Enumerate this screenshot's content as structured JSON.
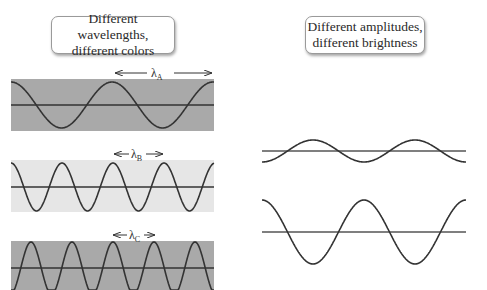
{
  "left_panel": {
    "title_line1": "Different wavelengths,",
    "title_line2": "different colors",
    "waves": [
      {
        "id": "A",
        "label": "λ",
        "subscript": "A",
        "background": "#a9a9a9",
        "wavelength_px": 101,
        "amplitude_px": 24
      },
      {
        "id": "B",
        "label": "λ",
        "subscript": "B",
        "background": "#e6e6e6",
        "wavelength_px": 51,
        "amplitude_px": 24
      },
      {
        "id": "C",
        "label": "λ",
        "subscript": "C",
        "background": "#a9a9a9",
        "wavelength_px": 41,
        "amplitude_px": 24
      }
    ]
  },
  "right_panel": {
    "title_line1": "Different amplitudes,",
    "title_line2": "different brightness",
    "waves": [
      {
        "id": "small",
        "amplitude_px": 11,
        "wavelength_px": 102
      },
      {
        "id": "large",
        "amplitude_px": 32,
        "wavelength_px": 102
      }
    ]
  },
  "colors": {
    "wave_stroke": "#333333",
    "dark_band": "#a9a9a9",
    "light_band": "#e6e6e6"
  }
}
